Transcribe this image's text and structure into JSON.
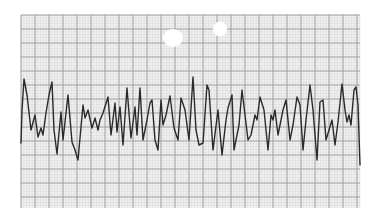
{
  "figure": {
    "width": 381,
    "height": 223
  },
  "grid": {
    "x0": 21,
    "y0": 15,
    "x1": 360,
    "y1": 208,
    "minor_spacing": 2.8,
    "major_spacing": 14,
    "minor_color": "#d6d6d6",
    "major_color": "#9a9a9a",
    "paper_color": "#f2f2f2"
  },
  "holes": [
    {
      "cx": 173,
      "cy": 38,
      "rx": 10,
      "ry": 9
    },
    {
      "cx": 220,
      "cy": 29,
      "rx": 7,
      "ry": 7.5
    }
  ],
  "trace": {
    "color": "#2a2a2a",
    "stroke_width": 1.4,
    "points": [
      [
        21,
        143
      ],
      [
        22,
        110
      ],
      [
        24,
        79
      ],
      [
        27,
        95
      ],
      [
        31,
        130
      ],
      [
        35,
        115
      ],
      [
        38,
        137
      ],
      [
        41,
        128
      ],
      [
        43,
        135
      ],
      [
        46,
        113
      ],
      [
        49,
        95
      ],
      [
        52,
        82
      ],
      [
        54,
        130
      ],
      [
        57,
        154
      ],
      [
        61,
        112
      ],
      [
        63,
        140
      ],
      [
        68,
        95
      ],
      [
        72,
        142
      ],
      [
        75,
        150
      ],
      [
        78,
        160
      ],
      [
        83,
        105
      ],
      [
        85,
        118
      ],
      [
        88,
        110
      ],
      [
        92,
        128
      ],
      [
        95,
        118
      ],
      [
        98,
        130
      ],
      [
        100,
        120
      ],
      [
        103,
        113
      ],
      [
        108,
        97
      ],
      [
        111,
        135
      ],
      [
        115,
        103
      ],
      [
        117,
        132
      ],
      [
        120,
        107
      ],
      [
        123,
        145
      ],
      [
        127,
        88
      ],
      [
        131,
        138
      ],
      [
        135,
        107
      ],
      [
        137,
        135
      ],
      [
        140,
        88
      ],
      [
        143,
        140
      ],
      [
        147,
        120
      ],
      [
        150,
        103
      ],
      [
        152,
        100
      ],
      [
        155,
        140
      ],
      [
        158,
        150
      ],
      [
        161,
        100
      ],
      [
        163,
        125
      ],
      [
        166,
        115
      ],
      [
        170,
        96
      ],
      [
        174,
        128
      ],
      [
        178,
        140
      ],
      [
        181,
        98
      ],
      [
        185,
        110
      ],
      [
        189,
        140
      ],
      [
        193,
        77
      ],
      [
        196,
        130
      ],
      [
        199,
        145
      ],
      [
        203,
        143
      ],
      [
        207,
        85
      ],
      [
        209,
        90
      ],
      [
        213,
        150
      ],
      [
        218,
        110
      ],
      [
        222,
        155
      ],
      [
        226,
        120
      ],
      [
        228,
        108
      ],
      [
        232,
        95
      ],
      [
        234,
        150
      ],
      [
        239,
        125
      ],
      [
        242,
        90
      ],
      [
        245,
        115
      ],
      [
        248,
        140
      ],
      [
        251,
        135
      ],
      [
        255,
        115
      ],
      [
        257,
        120
      ],
      [
        260,
        97
      ],
      [
        264,
        110
      ],
      [
        268,
        150
      ],
      [
        271,
        115
      ],
      [
        273,
        120
      ],
      [
        275,
        110
      ],
      [
        278,
        135
      ],
      [
        283,
        110
      ],
      [
        286,
        100
      ],
      [
        290,
        140
      ],
      [
        293,
        125
      ],
      [
        297,
        97
      ],
      [
        300,
        105
      ],
      [
        303,
        150
      ],
      [
        306,
        120
      ],
      [
        310,
        85
      ],
      [
        313,
        110
      ],
      [
        317,
        160
      ],
      [
        320,
        102
      ],
      [
        323,
        100
      ],
      [
        326,
        140
      ],
      [
        329,
        130
      ],
      [
        332,
        120
      ],
      [
        335,
        145
      ],
      [
        338,
        122
      ],
      [
        342,
        84
      ],
      [
        345,
        110
      ],
      [
        347,
        122
      ],
      [
        349,
        115
      ],
      [
        351,
        125
      ],
      [
        354,
        90
      ],
      [
        356,
        87
      ],
      [
        358,
        105
      ],
      [
        360,
        165
      ]
    ]
  }
}
